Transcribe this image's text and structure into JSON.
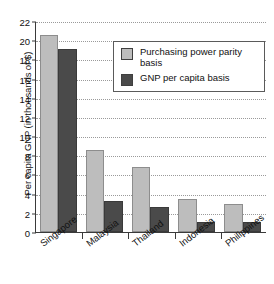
{
  "chart_data": {
    "type": "bar",
    "title": "",
    "xlabel": "",
    "ylabel": "Per capita GNP (in thousands of $)",
    "ylim": [
      0,
      22
    ],
    "ytick_step": 2,
    "yticks": [
      0,
      2,
      4,
      6,
      8,
      10,
      12,
      14,
      16,
      18,
      20,
      22
    ],
    "grid": true,
    "grid_axis": "y",
    "legend_position": "top-right",
    "categories": [
      "Singapore",
      "Malaysia",
      "Thailand",
      "Indonesia",
      "Philippines"
    ],
    "series": [
      {
        "name": "Purchasing power parity basis",
        "color": "#bdbdbd",
        "values": [
          20.5,
          8.5,
          6.8,
          3.45,
          2.9
        ]
      },
      {
        "name": "GNP per capita basis",
        "color": "#4a4a4a",
        "values": [
          19.1,
          3.2,
          2.6,
          1.05,
          1.0
        ]
      }
    ]
  },
  "legend": {
    "items": [
      {
        "label": "Purchasing power parity basis",
        "swatch": "ppp"
      },
      {
        "label": "GNP per capita basis",
        "swatch": "gnp"
      }
    ]
  },
  "colors": {
    "ppp_bar": "#bdbdbd",
    "gnp_bar": "#4a4a4a",
    "axis": "#3a3a3a",
    "grid": "#9a9a9a",
    "background": "#ffffff"
  }
}
